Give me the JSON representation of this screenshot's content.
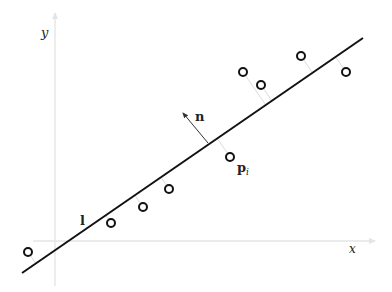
{
  "diagram": {
    "title": "",
    "axes": {
      "x_label": "x",
      "y_label": "y",
      "color": "#e4e4e4"
    },
    "line": {
      "label": "l",
      "from": [
        22,
        273
      ],
      "to": [
        363,
        38
      ],
      "color": "#111111"
    },
    "normal": {
      "label": "n",
      "from": [
        208,
        143
      ],
      "to": [
        183,
        113
      ],
      "color": "#333333"
    },
    "point_label": {
      "main": "p",
      "subscript": "i"
    },
    "points": [
      {
        "x": 28,
        "y": 252
      },
      {
        "x": 111,
        "y": 223
      },
      {
        "x": 143,
        "y": 207
      },
      {
        "x": 169,
        "y": 189
      },
      {
        "x": 230,
        "y": 157
      },
      {
        "x": 243,
        "y": 72
      },
      {
        "x": 261,
        "y": 85
      },
      {
        "x": 301,
        "y": 56
      },
      {
        "x": 346,
        "y": 72
      }
    ],
    "point_color": "#111111",
    "projection_color": "#dddddd"
  }
}
